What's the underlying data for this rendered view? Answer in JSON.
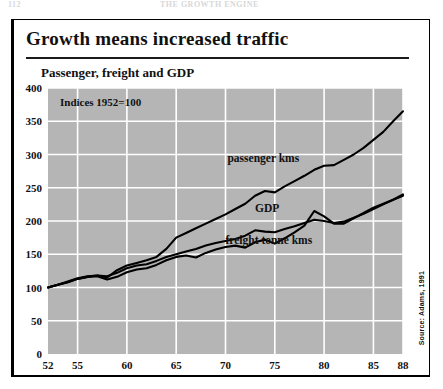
{
  "page_header": {
    "folio": "112",
    "running_title": "THE GROWTH ENGINE"
  },
  "figure": {
    "title": "Growth means increased traffic",
    "subtitle": "Passenger, freight and GDP",
    "source_note": "Source: Adams, 1991"
  },
  "chart_data": {
    "type": "line",
    "title": "Growth means increased traffic",
    "subtitle": "Passenger, freight and GDP",
    "annotation": "Indices 1952=100",
    "xlabel": "",
    "ylabel": "",
    "xlim": [
      52,
      88
    ],
    "ylim": [
      0,
      400
    ],
    "grid": true,
    "legend_position": "inline-labels",
    "background_color": "#b5b5b5",
    "gridline_color": "#ffffff",
    "line_color": "#000000",
    "xticks": [
      52,
      55,
      60,
      65,
      70,
      75,
      80,
      85,
      88
    ],
    "xtick_labels": [
      "52",
      "55",
      "60",
      "65",
      "70",
      "75",
      "80",
      "85",
      "88"
    ],
    "yticks": [
      0,
      50,
      100,
      150,
      200,
      250,
      300,
      350,
      400
    ],
    "ytick_labels": [
      "0",
      "50",
      "100",
      "150",
      "200",
      "250",
      "300",
      "350",
      "400"
    ],
    "x": [
      52,
      53,
      54,
      55,
      56,
      57,
      58,
      59,
      60,
      61,
      62,
      63,
      64,
      65,
      66,
      67,
      68,
      69,
      70,
      71,
      72,
      73,
      74,
      75,
      76,
      77,
      78,
      79,
      80,
      81,
      82,
      83,
      84,
      85,
      86,
      87,
      88
    ],
    "series": [
      {
        "name": "passenger kms",
        "label": "passenger kms",
        "values": [
          100,
          104,
          109,
          114,
          117,
          118,
          115,
          126,
          133,
          137,
          141,
          146,
          158,
          175,
          182,
          189,
          196,
          203,
          210,
          218,
          226,
          238,
          245,
          243,
          252,
          260,
          268,
          277,
          283,
          284,
          292,
          300,
          310,
          322,
          334,
          350,
          365
        ]
      },
      {
        "name": "GDP",
        "label": "GDP",
        "values": [
          100,
          104,
          108,
          113,
          116,
          118,
          117,
          122,
          129,
          133,
          135,
          140,
          146,
          150,
          154,
          158,
          163,
          167,
          170,
          173,
          178,
          186,
          184,
          183,
          188,
          192,
          197,
          202,
          200,
          197,
          199,
          205,
          211,
          218,
          225,
          232,
          240
        ]
      },
      {
        "name": "freight tonne kms",
        "label": "freight tonne kms",
        "values": [
          100,
          104,
          108,
          113,
          116,
          117,
          112,
          116,
          123,
          127,
          129,
          134,
          141,
          146,
          148,
          145,
          152,
          157,
          161,
          163,
          160,
          168,
          172,
          166,
          174,
          183,
          193,
          215,
          207,
          196,
          196,
          204,
          212,
          220,
          226,
          232,
          238
        ]
      }
    ]
  }
}
